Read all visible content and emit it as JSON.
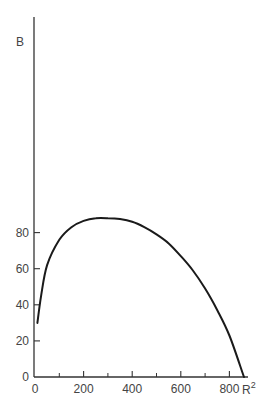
{
  "chart_data": {
    "type": "line",
    "title": "",
    "xlabel": "R²",
    "ylabel": "B",
    "xlim": [
      0,
      900
    ],
    "ylim": [
      0,
      95
    ],
    "grid": false,
    "legend": null,
    "x_ticks_major": [
      0,
      200,
      400,
      600,
      800
    ],
    "x_ticks_minor": [
      100,
      300,
      500,
      700
    ],
    "y_ticks": [
      0,
      20,
      40,
      60,
      80
    ],
    "series": [
      {
        "name": "B vs R²",
        "x": [
          10,
          25,
          50,
          100,
          150,
          200,
          250,
          300,
          350,
          400,
          450,
          500,
          550,
          600,
          650,
          700,
          750,
          800,
          860
        ],
        "values": [
          30,
          45,
          62,
          76,
          83,
          86.5,
          88,
          88,
          87.5,
          86,
          83,
          79,
          74,
          67,
          59,
          49,
          37,
          23,
          0
        ]
      }
    ]
  },
  "labels": {
    "ylabel": "B",
    "xlabel_base": "R",
    "xlabel_sup": "2",
    "x_ticks": [
      "0",
      "200",
      "400",
      "600",
      "800"
    ],
    "y_ticks": [
      "0",
      "20",
      "40",
      "60",
      "80"
    ]
  },
  "colors": {
    "axis": "#333333",
    "curve": "#1a1a1a",
    "text": "#444444"
  }
}
